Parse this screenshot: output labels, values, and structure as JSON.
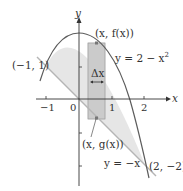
{
  "figure": {
    "type": "area-between-curves",
    "axes": {
      "x_label": "x",
      "y_label": "y",
      "x_ticks": [
        "−1",
        "0",
        "1",
        "2"
      ],
      "y_ticks": []
    },
    "curves": [
      {
        "name": "upper",
        "label": "y = 2 − x",
        "label_sup": "2",
        "expr": "2 - x^2"
      },
      {
        "name": "lower",
        "label": "y = −x",
        "expr": "-x"
      }
    ],
    "points": {
      "left_intersection": "(−1, 1)",
      "right_intersection": "(2, −2)",
      "top_point": "(x, f(x))",
      "bottom_point": "(x, g(x))"
    },
    "strip": {
      "width_label": "Δx"
    },
    "colors": {
      "region_fill": "#e6e6e6",
      "strip_fill": "#bdbdbd",
      "strip_outer": "#d9d9d9",
      "curve": "#5a5a5a",
      "line": "#b0b0b0",
      "axis": "#333333"
    }
  }
}
